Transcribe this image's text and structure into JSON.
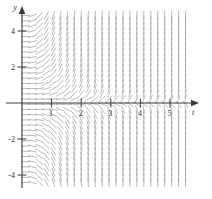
{
  "figure": {
    "kind": "slope-field",
    "axis_labels": {
      "x": "t",
      "y": "y"
    },
    "stroke_color": "#8d8d95",
    "axis_color": "#3a3a3a"
  },
  "chart_data": {
    "type": "scatter",
    "title": "",
    "xlabel": "t",
    "ylabel": "y",
    "xlim": [
      -0.25,
      5.7
    ],
    "ylim": [
      -5.1,
      5.3
    ],
    "grid": false,
    "legend": null,
    "xticks": [
      1,
      2,
      3,
      4,
      5
    ],
    "xtick_labels": [
      "1",
      "2",
      "3",
      "4",
      "5"
    ],
    "yticks": [
      4,
      2,
      -2,
      -4
    ],
    "ytick_labels": [
      "4",
      "2",
      "-2",
      "-4"
    ],
    "slope_function": "t*t*y",
    "sample_t": [
      0.0,
      0.5,
      1.0,
      1.5,
      2.0,
      2.5,
      3.0,
      3.5,
      4.0,
      4.5,
      5.0,
      5.5
    ],
    "sample_y": [
      -5.0,
      -4.0,
      -3.0,
      -2.0,
      -1.0,
      0.0,
      1.0,
      2.0,
      3.0,
      4.0,
      5.0
    ],
    "arrow_len_px": 9,
    "grid_step_t": 0.235,
    "grid_step_y": 0.29
  },
  "axes": {
    "x_label": "t",
    "y_label": "y",
    "x_tick_labels": [
      "1",
      "2",
      "3",
      "4",
      "5"
    ],
    "y_tick_labels": [
      "4",
      "2",
      "-2",
      "-4"
    ]
  }
}
